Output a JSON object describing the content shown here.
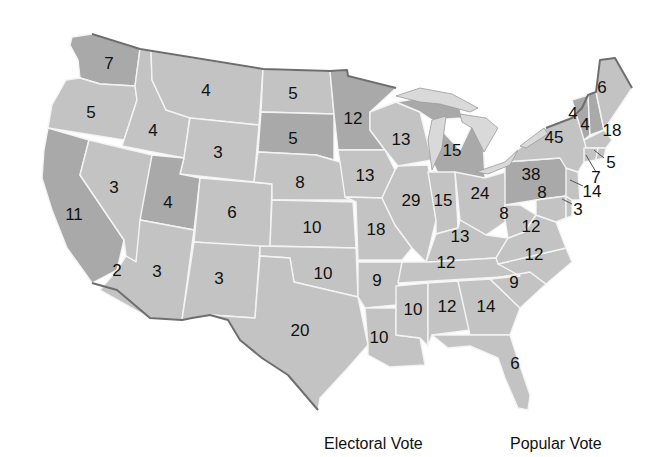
{
  "map": {
    "type": "us-states-electoral-votes",
    "colors": {
      "light_state": "#c3c3c3",
      "dark_state": "#a9a9a9",
      "lake": "#d9d9d9",
      "border": "#f4f4f4",
      "coast": "#6e6e6e"
    },
    "states": [
      {
        "id": "WA",
        "value": "7",
        "shade": "dark"
      },
      {
        "id": "OR",
        "value": "5",
        "shade": "light"
      },
      {
        "id": "CA",
        "value": "11",
        "shade": "dark"
      },
      {
        "id": "NV",
        "value": "3",
        "shade": "light"
      },
      {
        "id": "ID",
        "value": "4",
        "shade": "light"
      },
      {
        "id": "MT",
        "value": "4",
        "shade": "light"
      },
      {
        "id": "WY",
        "value": "3",
        "shade": "light"
      },
      {
        "id": "UT",
        "value": "4",
        "shade": "dark"
      },
      {
        "id": "AZ",
        "value": "3",
        "shade": "light"
      },
      {
        "id": "AZ-CA-split",
        "value": "2",
        "shade": "light"
      },
      {
        "id": "CO",
        "value": "6",
        "shade": "light"
      },
      {
        "id": "NM",
        "value": "3",
        "shade": "light"
      },
      {
        "id": "ND",
        "value": "5",
        "shade": "light"
      },
      {
        "id": "SD",
        "value": "5",
        "shade": "dark"
      },
      {
        "id": "NE",
        "value": "8",
        "shade": "light"
      },
      {
        "id": "KS",
        "value": "10",
        "shade": "light"
      },
      {
        "id": "OK",
        "value": "10",
        "shade": "light"
      },
      {
        "id": "TX",
        "value": "20",
        "shade": "light"
      },
      {
        "id": "MN",
        "value": "12",
        "shade": "dark"
      },
      {
        "id": "IA",
        "value": "13",
        "shade": "light"
      },
      {
        "id": "MO",
        "value": "18",
        "shade": "light"
      },
      {
        "id": "AR",
        "value": "9",
        "shade": "light"
      },
      {
        "id": "LA",
        "value": "10",
        "shade": "light"
      },
      {
        "id": "WI",
        "value": "13",
        "shade": "light"
      },
      {
        "id": "IL",
        "value": "29",
        "shade": "light"
      },
      {
        "id": "MI",
        "value": "15",
        "shade": "dark"
      },
      {
        "id": "IN",
        "value": "15",
        "shade": "light"
      },
      {
        "id": "OH",
        "value": "24",
        "shade": "light"
      },
      {
        "id": "KY",
        "value": "13",
        "shade": "light"
      },
      {
        "id": "TN",
        "value": "12",
        "shade": "light"
      },
      {
        "id": "MS",
        "value": "10",
        "shade": "light"
      },
      {
        "id": "AL",
        "value": "12",
        "shade": "light"
      },
      {
        "id": "GA",
        "value": "14",
        "shade": "light"
      },
      {
        "id": "FL",
        "value": "6",
        "shade": "light"
      },
      {
        "id": "SC",
        "value": "9",
        "shade": "light"
      },
      {
        "id": "NC",
        "value": "12",
        "shade": "light"
      },
      {
        "id": "VA",
        "value": "12",
        "shade": "light"
      },
      {
        "id": "WV",
        "value": "8",
        "shade": "light"
      },
      {
        "id": "PA",
        "value": "38",
        "shade": "dark"
      },
      {
        "id": "NY",
        "value": "45",
        "shade": "light"
      },
      {
        "id": "VT",
        "value": "4",
        "shade": "dark"
      },
      {
        "id": "NH",
        "value": "4",
        "shade": "dark"
      },
      {
        "id": "ME",
        "value": "6",
        "shade": "light"
      },
      {
        "id": "MA",
        "value": "18",
        "shade": "light"
      },
      {
        "id": "RI",
        "value": "5",
        "shade": "light"
      },
      {
        "id": "CT",
        "value": "7",
        "shade": "light"
      },
      {
        "id": "NJ",
        "value": "14",
        "shade": "light"
      },
      {
        "id": "DE",
        "value": "3",
        "shade": "light"
      },
      {
        "id": "MD",
        "value": "8",
        "shade": "light"
      }
    ]
  },
  "legend": {
    "electoral_label": "Electoral Vote",
    "popular_label": "Popular Vote"
  }
}
